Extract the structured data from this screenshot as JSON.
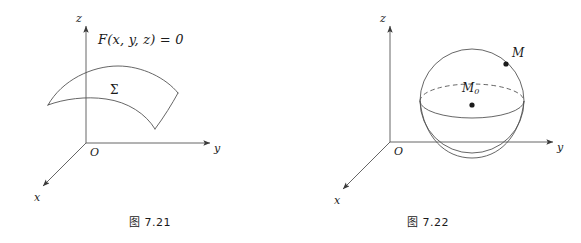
{
  "page": {
    "background_color": "#ffffff",
    "ink_color": "#1b1b1b",
    "stroke_color": "#555555"
  },
  "figures": [
    {
      "id": "figure-7-21",
      "caption": "图 7.21",
      "topic": "implicit-surface",
      "axes": {
        "z_label": "z",
        "y_label": "y",
        "x_label": "x",
        "origin_label": "O"
      },
      "annotations": {
        "equation": "F(x, y, z) = 0",
        "surface_label": "Σ"
      }
    },
    {
      "id": "figure-7-22",
      "caption": "图 7.22",
      "topic": "sphere-neighborhood",
      "axes": {
        "z_label": "z",
        "y_label": "y",
        "x_label": "x",
        "origin_label": "O"
      },
      "annotations": {
        "center_point_label": "M",
        "center_point_subscript": "0",
        "surface_point_label": "M"
      }
    }
  ]
}
